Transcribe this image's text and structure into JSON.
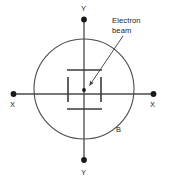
{
  "diagram": {
    "type": "schematic",
    "colors": {
      "stroke": "#4a4a4a",
      "plate_stroke": "#3a3a3a",
      "terminal_fill": "#1a1a1a",
      "text": "#2b2b2b",
      "background": "#ffffff"
    },
    "geometry": {
      "center_x": 84,
      "center_y": 89,
      "circle_radius": 50,
      "plate_gap_vertical": 38,
      "plate_gap_horizontal": 33
    },
    "labels": {
      "y_top": "Y",
      "y_bottom": "Y",
      "x_left": "X",
      "x_right": "X",
      "beam_point": "B",
      "electron_beam_line1": "Electron",
      "electron_beam_line2": "beam"
    },
    "elements": {
      "envelope": "circle",
      "top_plate": "Y-deflection plate (top)",
      "bottom_plate": "Y-deflection plate (bottom)",
      "left_plate": "X-deflection plate (left)",
      "right_plate": "X-deflection plate (right)",
      "center_dot": "electron beam spot",
      "pointer": "leader arrow to beam"
    },
    "terminals": [
      {
        "name": "y-top-terminal",
        "x": 84,
        "y": 18
      },
      {
        "name": "y-bottom-terminal",
        "x": 84,
        "y": 162
      },
      {
        "name": "x-left-terminal",
        "x": 12,
        "y": 94
      },
      {
        "name": "x-right-terminal",
        "x": 154,
        "y": 94
      }
    ]
  }
}
